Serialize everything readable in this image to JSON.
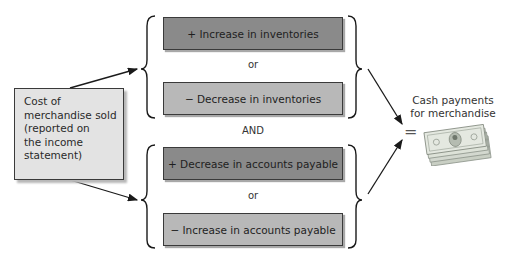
{
  "diagram": {
    "source": {
      "lines": [
        "Cost of",
        "merchandise sold",
        "(reported on",
        "the income",
        "statement)"
      ]
    },
    "groups": [
      {
        "items": [
          {
            "label": "+ Increase in inventories",
            "shade": "dark"
          },
          {
            "label": "− Decrease in inventories",
            "shade": "light"
          }
        ],
        "separator": "or"
      },
      {
        "items": [
          {
            "label": "+ Decrease in accounts payable",
            "shade": "dark"
          },
          {
            "label": "− Increase in accounts payable",
            "shade": "light"
          }
        ],
        "separator": "or"
      }
    ],
    "group_connector": "AND",
    "equals_sign": "=",
    "result": {
      "lines": [
        "Cash payments",
        "for merchandise"
      ],
      "icon": "money-stack-icon"
    },
    "colors": {
      "dark_box": "#8a8a8a",
      "light_box": "#b8b8b8",
      "source_box": "#e3e3e3",
      "border": "#3a3a3a"
    }
  }
}
